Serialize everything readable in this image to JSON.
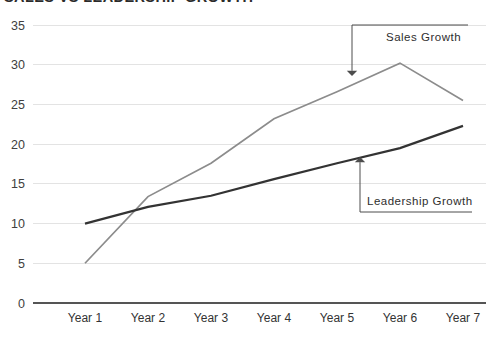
{
  "chart_data": {
    "type": "line",
    "title": "SALES VS LEADERSHIP GROWTH",
    "xlabel": "",
    "ylabel": "",
    "categories": [
      "Year 1",
      "Year 2",
      "Year 3",
      "Year 4",
      "Year 5",
      "Year 6",
      "Year 7"
    ],
    "ylim": [
      0,
      35
    ],
    "y_ticks": [
      "0",
      "5",
      "10",
      "15",
      "20",
      "25",
      "30",
      "35"
    ],
    "y_tick_values": [
      0,
      5,
      10,
      15,
      20,
      25,
      30,
      35
    ],
    "grid": true,
    "grid_axis": "y",
    "legend": "none",
    "series": [
      {
        "name": "Sales Growth",
        "color": "#8c8c8c",
        "width": 1.7,
        "values": [
          5,
          13.4,
          17.6,
          23.2,
          26.6,
          30.2,
          25.5
        ]
      },
      {
        "name": "Leadership Growth",
        "color": "#333333",
        "width": 2.2,
        "values": [
          10,
          12.1,
          13.5,
          15.6,
          17.6,
          19.5,
          22.3
        ]
      }
    ],
    "annotations": [
      {
        "label": "Sales Growth",
        "label_x": 386,
        "label_y": 41,
        "arrow_direction": "down",
        "elbow_x": 352,
        "elbow_y": 25,
        "elbow_x2": 468,
        "tip_x": 352,
        "tip_y": 76,
        "color": "#4d4d4d"
      },
      {
        "label": "Leadership Growth",
        "label_x": 367,
        "label_y": 205,
        "arrow_direction": "up",
        "elbow_x": 360,
        "elbow_y": 212,
        "elbow_x2": 472,
        "tip_x": 360,
        "tip_y": 157,
        "color": "#4d4d4d"
      }
    ],
    "colors": {
      "sales_line": "#8c8c8c",
      "leadership_line": "#333333",
      "gridline": "#e3e3e3",
      "axis": "#555555",
      "text": "#333333",
      "background": "#ffffff"
    },
    "geometry": {
      "plot_left": 33,
      "plot_right": 486,
      "plot_top": 25,
      "plot_bottom": 303,
      "x_positions": [
        85,
        148,
        211,
        274,
        337,
        400,
        463
      ],
      "x_label_y": 322
    }
  }
}
